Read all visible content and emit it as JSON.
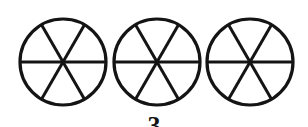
{
  "figure": {
    "background_color": "#ffffff",
    "line_color": "#141414",
    "fill_color": "#ffffff",
    "width": 308,
    "height": 127
  },
  "shapes": {
    "kind": "circle-divided-into-sectors",
    "count": 3,
    "sectors_per_circle": 6,
    "stroke_width": 3.2,
    "divider_stroke_width": 3.0,
    "divider_angles_degrees": [
      0,
      60,
      120
    ],
    "circles": [
      {
        "label": "circle-1",
        "cx": 63,
        "cy": 62,
        "r": 43
      },
      {
        "label": "circle-2",
        "cx": 157,
        "cy": 62,
        "r": 43
      },
      {
        "label": "circle-3",
        "cx": 250,
        "cy": 62,
        "r": 43
      }
    ]
  },
  "caption": {
    "text": "3",
    "clipped": true
  }
}
